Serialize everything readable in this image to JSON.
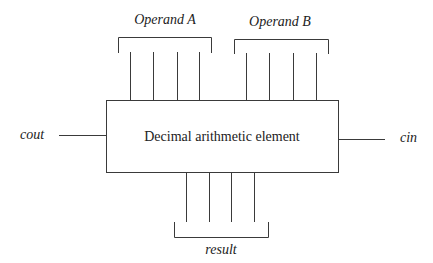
{
  "diagram": {
    "block": {
      "label": "Decimal arithmetic element"
    },
    "inputs": {
      "operand_a": {
        "label": "Operand A",
        "lines": 4
      },
      "operand_b": {
        "label": "Operand B",
        "lines": 4
      },
      "cin": {
        "label": "cin"
      }
    },
    "outputs": {
      "result": {
        "label": "result",
        "lines": 4
      },
      "cout": {
        "label": "cout"
      }
    }
  }
}
